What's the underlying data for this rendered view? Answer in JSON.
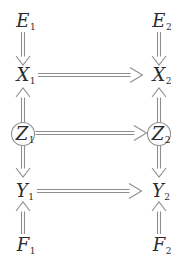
{
  "diagram_title": "temporal-causal-graph",
  "nodes": {
    "E1": {
      "base": "E",
      "sub": "1"
    },
    "E2": {
      "base": "E",
      "sub": "2"
    },
    "X1": {
      "base": "X",
      "sub": "1"
    },
    "X2": {
      "base": "X",
      "sub": "2"
    },
    "Z1": {
      "base": "Z",
      "sub": "1",
      "shape": "circle"
    },
    "Z2": {
      "base": "Z",
      "sub": "2",
      "shape": "circle"
    },
    "Y1": {
      "base": "Y",
      "sub": "1"
    },
    "Y2": {
      "base": "Y",
      "sub": "2"
    },
    "F1": {
      "base": "F",
      "sub": "1"
    },
    "F2": {
      "base": "F",
      "sub": "2"
    }
  },
  "edges": [
    {
      "from": "E1",
      "to": "X1"
    },
    {
      "from": "E2",
      "to": "X2"
    },
    {
      "from": "Z1",
      "to": "X1"
    },
    {
      "from": "Z2",
      "to": "X2"
    },
    {
      "from": "X1",
      "to": "X2"
    },
    {
      "from": "Z1",
      "to": "Z2"
    },
    {
      "from": "Z1",
      "to": "Y1"
    },
    {
      "from": "Z2",
      "to": "Y2"
    },
    {
      "from": "Y1",
      "to": "Y2"
    },
    {
      "from": "F1",
      "to": "Y1"
    },
    {
      "from": "F2",
      "to": "Y2"
    }
  ],
  "arrow_style": "double-line shaft, open V head",
  "colors": {
    "background": "#ffffff",
    "line": "#8e8e8e",
    "text": "#2b2b2b",
    "node_fill": "#ffffff"
  }
}
